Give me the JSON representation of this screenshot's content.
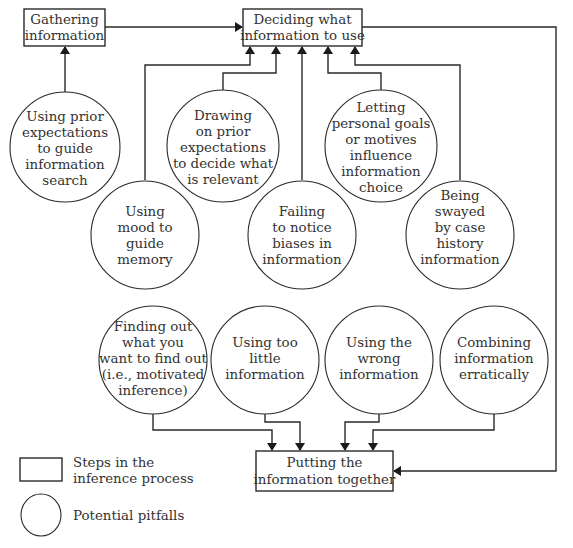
{
  "diagram": {
    "steps": [
      {
        "id": "gathering",
        "lines": [
          "Gathering",
          "information"
        ]
      },
      {
        "id": "deciding",
        "lines": [
          "Deciding what",
          "information to use"
        ]
      },
      {
        "id": "putting",
        "lines": [
          "Putting the",
          "information together"
        ]
      }
    ],
    "pitfalls": [
      {
        "id": "prior-search",
        "lines": [
          "Using prior",
          "expectations",
          "to guide",
          "information",
          "search"
        ],
        "target": "gathering"
      },
      {
        "id": "drawing-prior",
        "lines": [
          "Drawing",
          "on prior",
          "expectations",
          "to decide what",
          "is relevant"
        ],
        "target": "deciding"
      },
      {
        "id": "letting-goals",
        "lines": [
          "Letting",
          "personal goals",
          "or motives",
          "influence",
          "information",
          "choice"
        ],
        "target": "deciding"
      },
      {
        "id": "mood-memory",
        "lines": [
          "Using",
          "mood to",
          "guide",
          "memory"
        ],
        "target": "deciding"
      },
      {
        "id": "failing-biases",
        "lines": [
          "Failing",
          "to notice",
          "biases in",
          "information"
        ],
        "target": "deciding"
      },
      {
        "id": "case-history",
        "lines": [
          "Being",
          "swayed",
          "by case",
          "history",
          "information"
        ],
        "target": "deciding"
      },
      {
        "id": "motivated-inference",
        "lines": [
          "Finding out",
          "what you",
          "want to find out",
          "(i.e., motivated",
          "inference)"
        ],
        "target": "putting"
      },
      {
        "id": "too-little",
        "lines": [
          "Using too",
          "little",
          "information"
        ],
        "target": "putting"
      },
      {
        "id": "wrong-info",
        "lines": [
          "Using the",
          "wrong",
          "information"
        ],
        "target": "putting"
      },
      {
        "id": "erratic",
        "lines": [
          "Combining",
          "information",
          "erratically"
        ],
        "target": "putting"
      }
    ],
    "flow": [
      {
        "from": "gathering",
        "to": "deciding"
      },
      {
        "from": "deciding",
        "to": "putting"
      }
    ],
    "legend": {
      "box_lines": [
        "Steps in the",
        "inference process"
      ],
      "circle_label": "Potential pitfalls"
    }
  }
}
